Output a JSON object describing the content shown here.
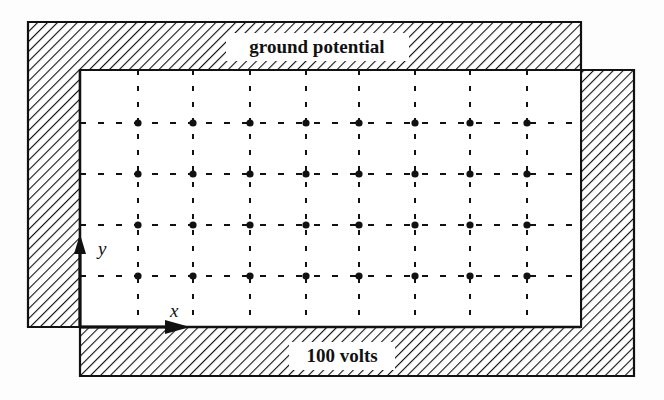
{
  "diagram": {
    "labels": {
      "ground": "ground potential",
      "voltage": "100 volts",
      "x_axis": "x",
      "y_axis": "y"
    },
    "colors": {
      "ink": "#111111",
      "background": "#fdfdfd",
      "interior": "#ffffff"
    },
    "grid": {
      "columns_x": [
        138,
        193,
        250,
        306,
        359,
        415,
        470,
        527
      ],
      "rows_y": [
        123,
        174,
        225,
        276
      ],
      "interior": {
        "left": 80,
        "top": 70,
        "right": 581,
        "bottom": 327
      }
    },
    "boundaries": [
      {
        "name": "ground-boundary",
        "label": "ground potential",
        "sides": [
          "top",
          "left"
        ]
      },
      {
        "name": "voltage-boundary",
        "label": "100 volts",
        "sides": [
          "bottom",
          "right"
        ]
      }
    ]
  }
}
